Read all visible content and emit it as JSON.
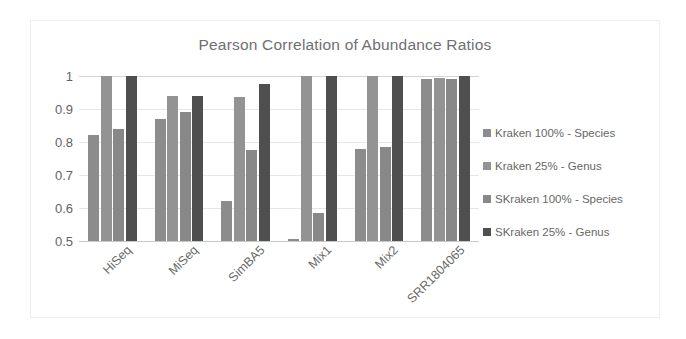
{
  "chart_data": {
    "type": "bar",
    "title": "Pearson Correlation of Abundance Ratios",
    "xlabel": "",
    "ylabel": "",
    "ylim": [
      0.5,
      1.0
    ],
    "yticks": [
      "1",
      "0.9",
      "0.8",
      "0.7",
      "0.6",
      "0.5"
    ],
    "ytick_values": [
      1.0,
      0.9,
      0.8,
      0.7,
      0.6,
      0.5
    ],
    "grid": true,
    "legend_position": "right",
    "categories": [
      "HiSeq",
      "MiSeq",
      "SimBA5",
      "Mix1",
      "Mix2",
      "SRR1804065"
    ],
    "series": [
      {
        "name": "Kraken 100% - Species",
        "color": "#8c8c8c",
        "values": [
          0.82,
          0.87,
          0.62,
          0.505,
          0.78,
          0.99
        ]
      },
      {
        "name": "Kraken 25% - Genus",
        "color": "#939393",
        "values": [
          1.0,
          0.94,
          0.935,
          1.0,
          1.0,
          0.995
        ]
      },
      {
        "name": "SKraken 100% - Species",
        "color": "#888888",
        "values": [
          0.84,
          0.89,
          0.775,
          0.585,
          0.785,
          0.99
        ]
      },
      {
        "name": "SKraken 25% - Genus",
        "color": "#4f4f4f",
        "values": [
          1.0,
          0.94,
          0.975,
          1.0,
          1.0,
          1.0
        ]
      }
    ]
  },
  "legend": {
    "items": [
      {
        "label": "Kraken 100% - Species",
        "color": "#8c8c8c"
      },
      {
        "label": "Kraken 25% - Genus",
        "color": "#939393"
      },
      {
        "label": "SKraken 100% - Species",
        "color": "#888888"
      },
      {
        "label": "SKraken 25% - Genus",
        "color": "#4f4f4f"
      }
    ]
  }
}
